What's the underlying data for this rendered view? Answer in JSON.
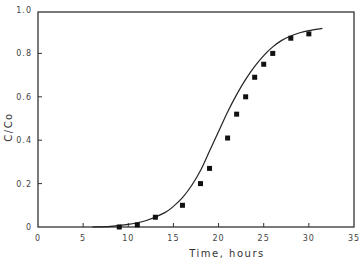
{
  "chart_data": {
    "type": "scatter",
    "title": "",
    "xlabel": "Time, hours",
    "ylabel": "C/Co",
    "xlim": [
      0,
      35
    ],
    "ylim": [
      0,
      1.0
    ],
    "xticks": [
      0,
      5,
      10,
      15,
      20,
      25,
      30,
      35
    ],
    "xtick_labels": [
      "0",
      "5",
      "10",
      "15",
      "20",
      "25",
      "30",
      "35"
    ],
    "yticks": [
      0,
      0.2,
      0.4,
      0.6,
      0.8,
      1.0
    ],
    "ytick_labels": [
      "0",
      "0.2",
      "0.4",
      "0.6",
      "0.8",
      "1.0"
    ],
    "grid": false,
    "legend": null,
    "series": [
      {
        "name": "Measured",
        "marker": "square",
        "x": [
          9,
          11,
          13,
          16,
          18,
          19,
          21,
          22,
          23,
          24,
          25,
          26,
          28,
          30
        ],
        "y": [
          0.0,
          0.01,
          0.045,
          0.1,
          0.2,
          0.27,
          0.41,
          0.52,
          0.6,
          0.69,
          0.75,
          0.8,
          0.87,
          0.89
        ]
      },
      {
        "name": "Model fit",
        "style": "line",
        "x": [
          6,
          8,
          10,
          12,
          14,
          15,
          16,
          17,
          18,
          19,
          20,
          21,
          22,
          23,
          24,
          25,
          26,
          27,
          28,
          29,
          30,
          31.5
        ],
        "y": [
          0.0,
          0.003,
          0.012,
          0.03,
          0.065,
          0.095,
          0.135,
          0.19,
          0.26,
          0.35,
          0.44,
          0.53,
          0.61,
          0.68,
          0.74,
          0.79,
          0.83,
          0.86,
          0.88,
          0.895,
          0.905,
          0.915
        ]
      }
    ]
  }
}
